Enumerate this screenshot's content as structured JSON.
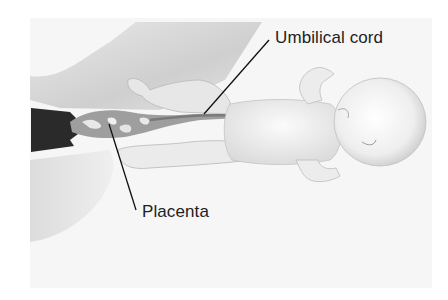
{
  "diagram": {
    "labels": [
      {
        "id": "umbilical-cord",
        "text": "Umbilical cord"
      },
      {
        "id": "placenta",
        "text": "Placenta"
      }
    ],
    "colors": {
      "background": "#f6f6f6",
      "text": "#222222",
      "leader_line": "#111111",
      "placenta_dark": "#2a2a2a",
      "shading": "#d4d4d4"
    }
  }
}
